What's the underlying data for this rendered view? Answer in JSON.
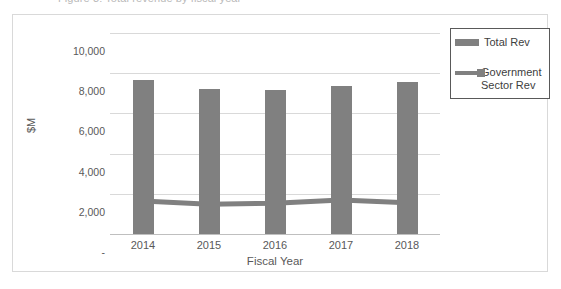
{
  "ghost": {
    "clipped_text_above": "Figure 3: Total revenue by fiscal year"
  },
  "chart_data": {
    "type": "bar",
    "title": "",
    "xlabel": "Fiscal Year",
    "ylabel": "$M",
    "categories": [
      "2014",
      "2015",
      "2016",
      "2017",
      "2018"
    ],
    "ylim": [
      0,
      10000
    ],
    "ytick_labels": [
      "10,000",
      "8,000",
      "6,000",
      "4,000",
      "2,000",
      "-"
    ],
    "ytick_values": [
      10000,
      8000,
      6000,
      4000,
      2000,
      0
    ],
    "grid": true,
    "legend_position": "top-right",
    "series": [
      {
        "name": "Total Rev",
        "type": "bar",
        "color": "#808080",
        "values": [
          7650,
          7220,
          7180,
          7380,
          7540
        ]
      },
      {
        "name": "Government\nSector Rev",
        "legend_label": "Government\nSector Rev",
        "type": "line",
        "color": "#808080",
        "values": [
          1640,
          1480,
          1530,
          1690,
          1550
        ]
      }
    ]
  },
  "legend": {
    "entries": [
      {
        "label": "Total Rev",
        "swatch": "bar-swatch",
        "color": "#808080"
      },
      {
        "label": "Government\nSector Rev",
        "swatch": "line-swatch",
        "color": "#808080"
      }
    ]
  },
  "axes": {
    "y_title": "$M",
    "x_title": "Fiscal Year"
  }
}
